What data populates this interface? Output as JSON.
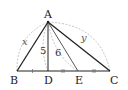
{
  "diagram": {
    "type": "triangle",
    "points": {
      "A": {
        "label": "A",
        "x": 48,
        "y": 22
      },
      "B": {
        "label": "B",
        "x": 17,
        "y": 71
      },
      "D": {
        "label": "D",
        "x": 48,
        "y": 71
      },
      "E": {
        "label": "E",
        "x": 78,
        "y": 71
      },
      "C": {
        "label": "C",
        "x": 110,
        "y": 71
      }
    },
    "segment_labels": {
      "AB": "x",
      "AC": "y",
      "AD": "5",
      "AE": "6"
    },
    "tick_marks": {
      "BD": 1,
      "DE": 2,
      "EC": 2
    }
  }
}
